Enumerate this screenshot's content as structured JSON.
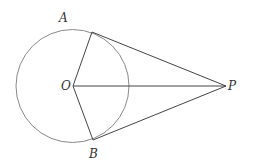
{
  "diagram": {
    "type": "geometry",
    "circle": {
      "center": "O",
      "cx": 72.5,
      "cy": 86,
      "r": 56.5,
      "stroke": "#8a8a8a"
    },
    "points": {
      "A": {
        "label": "A",
        "x": 92,
        "y": 32,
        "label_x": 59,
        "label_y": 22
      },
      "B": {
        "label": "B",
        "x": 93,
        "y": 140,
        "label_x": 89,
        "label_y": 158
      },
      "O": {
        "label": "O",
        "x": 73,
        "y": 86,
        "label_x": 61,
        "label_y": 90
      },
      "P": {
        "label": "P",
        "x": 226,
        "y": 86,
        "label_x": 228,
        "label_y": 90
      }
    },
    "segments": [
      {
        "name": "OA",
        "from": "O",
        "to": "A"
      },
      {
        "name": "OB",
        "from": "O",
        "to": "B"
      },
      {
        "name": "OP",
        "from": "O",
        "to": "P"
      },
      {
        "name": "PA",
        "from": "P",
        "to": "A"
      },
      {
        "name": "PB",
        "from": "P",
        "to": "B"
      }
    ],
    "line_color": "#444444"
  }
}
